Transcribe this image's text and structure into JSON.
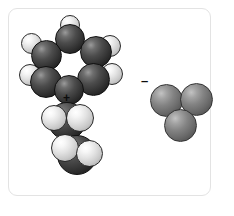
{
  "figure": {
    "caption": "Space-filling molecular models of an ion pair",
    "background_color": "#ffffff",
    "frame_color": "#e3e3e3",
    "atom_colors": {
      "carbon_dark": "#343434",
      "hydrogen_light": "#e2e2e2",
      "anion_mid_gray": "#838383"
    }
  },
  "cation": {
    "name": "cation-space-filling-model",
    "charge_symbol": "+",
    "charge_label": "positive charge",
    "ring_atoms": [
      {
        "label": "C1",
        "kind": "dark",
        "x": 55,
        "y": 24,
        "d": 30
      },
      {
        "label": "C2",
        "kind": "dark",
        "x": 80,
        "y": 36,
        "d": 32
      },
      {
        "label": "C3",
        "kind": "dark",
        "x": 31,
        "y": 40,
        "d": 31
      },
      {
        "label": "C4",
        "kind": "dark",
        "x": 77,
        "y": 63,
        "d": 33
      },
      {
        "label": "C5",
        "kind": "dark",
        "x": 30,
        "y": 66,
        "d": 32
      },
      {
        "label": "C6",
        "kind": "dark",
        "x": 54,
        "y": 75,
        "d": 30
      }
    ],
    "ring_hydrogens": [
      {
        "label": "H1",
        "kind": "light",
        "x": 60,
        "y": 15,
        "d": 20
      },
      {
        "label": "H2",
        "kind": "light",
        "x": 99,
        "y": 35,
        "d": 22
      },
      {
        "label": "H3",
        "kind": "light",
        "x": 21,
        "y": 33,
        "d": 21
      },
      {
        "label": "H4",
        "kind": "light",
        "x": 101,
        "y": 63,
        "d": 22
      },
      {
        "label": "H5",
        "kind": "light",
        "x": 19,
        "y": 64,
        "d": 22
      }
    ],
    "side_chain_atoms": [
      {
        "label": "C7",
        "kind": "dark",
        "x": 48,
        "y": 102,
        "d": 38
      },
      {
        "label": "C8",
        "kind": "dark",
        "x": 57,
        "y": 135,
        "d": 40
      }
    ],
    "side_chain_hydrogens": [
      {
        "label": "H6",
        "kind": "light",
        "x": 41,
        "y": 105,
        "d": 26
      },
      {
        "label": "H7",
        "kind": "light",
        "x": 66,
        "y": 104,
        "d": 28
      },
      {
        "label": "H8",
        "kind": "light",
        "x": 51,
        "y": 134,
        "d": 28
      },
      {
        "label": "H9",
        "kind": "light",
        "x": 76,
        "y": 140,
        "d": 27
      }
    ],
    "charge_position": {
      "x": 63,
      "y": 92
    }
  },
  "anion": {
    "name": "anion-space-filling-model",
    "charge_symbol": "–",
    "charge_label": "negative charge",
    "atoms": [
      {
        "label": "X1",
        "kind": "mid",
        "x": 150,
        "y": 84,
        "d": 33
      },
      {
        "label": "X2",
        "kind": "mid",
        "x": 180,
        "y": 83,
        "d": 33
      },
      {
        "label": "X3",
        "kind": "mid",
        "x": 164,
        "y": 109,
        "d": 33
      }
    ],
    "charge_position": {
      "x": 141,
      "y": 74
    }
  }
}
